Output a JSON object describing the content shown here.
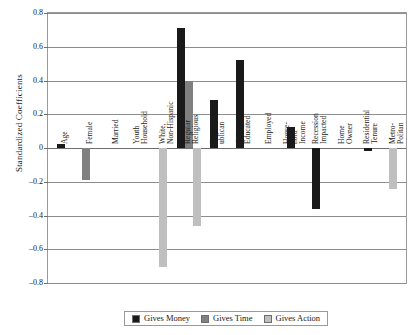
{
  "chart_data": {
    "type": "bar",
    "title": "",
    "xlabel": "",
    "ylabel": "Standardized Coefficients",
    "ylim": [
      -0.8,
      0.8
    ],
    "yticks": [
      0.8,
      0.6,
      0.4,
      0.2,
      0,
      -0.2,
      -0.4,
      -0.6,
      -0.8
    ],
    "ytick_labels": [
      "0.8",
      "0.6",
      "0.4",
      "0.2",
      "0",
      "–0.2",
      "–0.4",
      "–0.6",
      "–0.8"
    ],
    "grid": true,
    "legend_position": "bottom",
    "categories": [
      "Age",
      "Female",
      "Married",
      "Youth Household",
      "White, Non-Hispanic",
      "Regular Religious",
      "Rep-ublican",
      "College Educated",
      "Employed",
      "House-hold Income",
      "Recession Impacted",
      "Home Owner",
      "Residential Tenure",
      "Metro-Politan"
    ],
    "category_labels": [
      "Age",
      "Female",
      "Married",
      "Youth\nHousehold",
      "White,\nNon-Hispanic",
      "Regular\nReligious",
      "Rep-\nublican",
      "College\nEducated",
      "Employed",
      "House-\nhold\nIncome",
      "Recession\nImpacted",
      "Home\nOwner",
      "Residential\nTenure",
      "Metro-\nPolitan"
    ],
    "series": [
      {
        "name": "Gives Money",
        "color": "#1a1a1a",
        "values": [
          0.025,
          null,
          null,
          null,
          null,
          0.71,
          0.285,
          0.52,
          null,
          0.125,
          -0.36,
          null,
          -0.015,
          null
        ]
      },
      {
        "name": "Gives Time",
        "color": "#808080",
        "values": [
          null,
          -0.19,
          null,
          null,
          null,
          0.395,
          null,
          null,
          null,
          null,
          null,
          null,
          null,
          null
        ]
      },
      {
        "name": "Gives Action",
        "color": "#bfbfbf",
        "values": [
          null,
          null,
          null,
          null,
          -0.705,
          -0.465,
          null,
          null,
          null,
          null,
          null,
          null,
          null,
          -0.24
        ]
      }
    ]
  },
  "legend": {
    "items": [
      {
        "label": "Gives Money",
        "color": "#1a1a1a"
      },
      {
        "label": "Gives Time",
        "color": "#808080"
      },
      {
        "label": "Gives Action",
        "color": "#bfbfbf"
      }
    ]
  }
}
